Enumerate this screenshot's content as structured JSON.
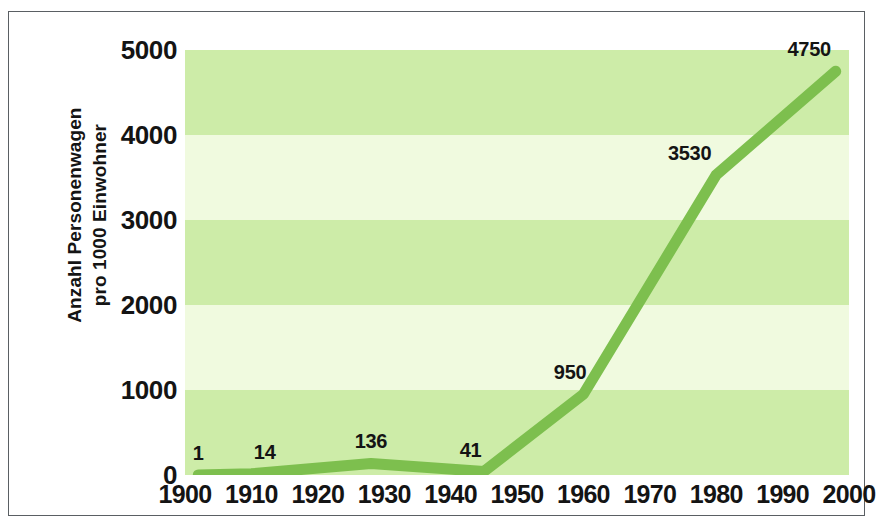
{
  "chart_data": {
    "type": "line",
    "title": "",
    "subtitle": "",
    "xlabel": "",
    "ylabel": "Anzahl Personenwagen pro 1000 Einwohner",
    "ylabel_lines": [
      "Anzahl Personenwagen",
      "pro 1000 Einwohner"
    ],
    "x": [
      1902,
      1910,
      1928,
      1945,
      1960,
      1980,
      1998
    ],
    "values": [
      1,
      14,
      136,
      41,
      950,
      3530,
      4750
    ],
    "point_labels": [
      "1",
      "14",
      "136",
      "41",
      "950",
      "3530",
      "4750"
    ],
    "label_years": [
      1902,
      1912,
      1928,
      1943,
      1958,
      1976,
      1994
    ],
    "xlim": [
      1900,
      2000
    ],
    "ylim": [
      0,
      5000
    ],
    "xticks": [
      1900,
      1910,
      1920,
      1930,
      1940,
      1950,
      1960,
      1970,
      1980,
      1990,
      2000
    ],
    "xtick_labels": [
      "1900",
      "1910",
      "1920",
      "1930",
      "1940",
      "1950",
      "1960",
      "1970",
      "1980",
      "1990",
      "2000"
    ],
    "yticks": [
      0,
      1000,
      2000,
      3000,
      4000,
      5000
    ],
    "ytick_labels": [
      "0",
      "1000",
      "2000",
      "3000",
      "4000",
      "5000"
    ],
    "grid": false,
    "legend": "none",
    "band_interval": 1000,
    "series": [
      {
        "name": "Anzahl Personenwagen pro 1000 Einwohner",
        "values": [
          1,
          14,
          136,
          41,
          950,
          3530,
          4750
        ]
      }
    ]
  },
  "colors": {
    "line": "#7dbf4e",
    "band_dark": "#cdeca8",
    "band_light": "#f0fadf",
    "frame": "#5a5f63",
    "text": "#141414",
    "background": "#ffffff"
  }
}
